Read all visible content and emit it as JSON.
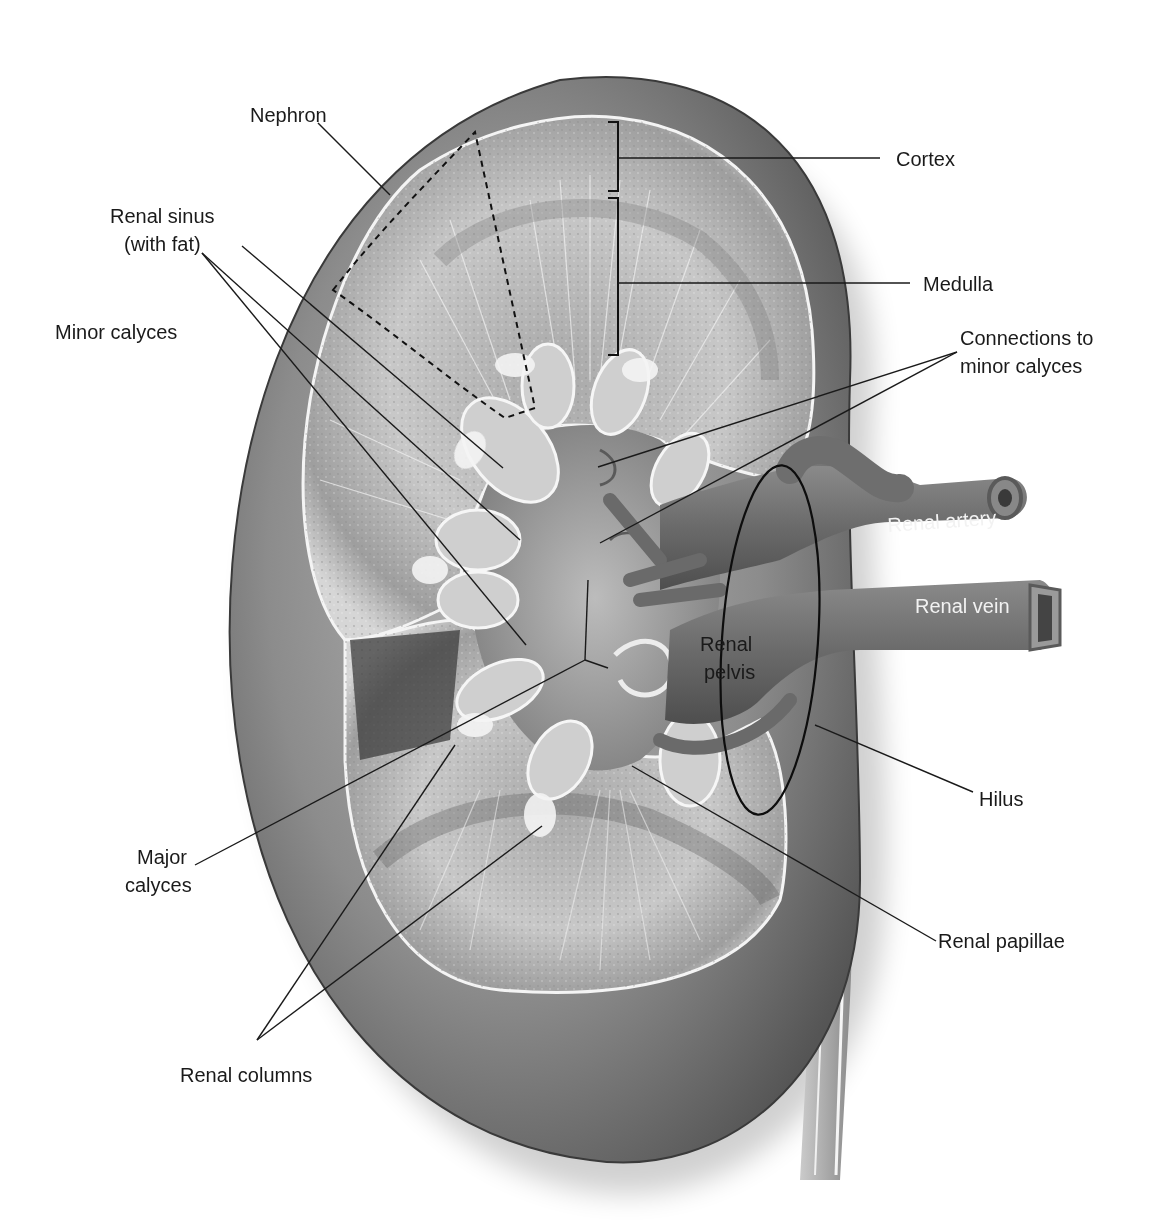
{
  "diagram": {
    "labels": {
      "nephron": "Nephron",
      "renal_sinus_line1": "Renal sinus",
      "renal_sinus_line2": "(with fat)",
      "minor_calyces": "Minor calyces",
      "cortex": "Cortex",
      "medulla": "Medulla",
      "connections_line1": "Connections to",
      "connections_line2": "minor calyces",
      "renal_artery": "Renal artery",
      "renal_vein": "Renal vein",
      "renal_pelvis_line1": "Renal",
      "renal_pelvis_line2": "pelvis",
      "hilus": "Hilus",
      "major_calyces_line1": "Major",
      "major_calyces_line2": "calyces",
      "renal_papillae": "Renal papillae",
      "renal_columns": "Renal columns"
    },
    "colors": {
      "background": "#ffffff",
      "capsule_dark": "#5a5a5a",
      "capsule_mid": "#8a8a8a",
      "tissue_light": "#d4d4d4",
      "tissue_mid": "#b0b0b0",
      "vessel": "#6e6e6e",
      "label_text": "#1a1a1a",
      "vessel_text": "#f2f2f2"
    }
  }
}
